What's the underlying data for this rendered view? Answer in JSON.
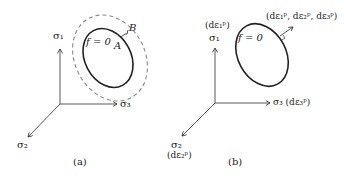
{
  "panel_a": {
    "caption": "(a)",
    "axis_sigma1": "σ₁",
    "axis_sigma2": "σ₂",
    "axis_sigma3": "σ₃",
    "surface_label": "f = 0",
    "point_A": "A",
    "point_B": "B"
  },
  "panel_b": {
    "caption": "(b)",
    "axis_sigma1": "σ₁",
    "axis_sigma1_strain": "(dε₁ᵖ)",
    "axis_sigma2": "σ₂",
    "axis_sigma2_strain": "(dε₂ᵖ)",
    "axis_sigma3": "σ₃ (dε₃ᵖ)",
    "surface_label": "f = 0",
    "normal_vector_label": "(dε₁ᵖ, dε₂ᵖ, dε₃ᵖ)"
  },
  "colors": {
    "line": "#222222",
    "dashed": "#888888"
  }
}
